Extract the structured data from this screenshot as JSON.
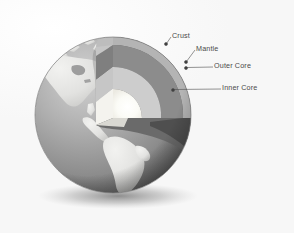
{
  "figure": {
    "background_color": "#fbfbfb",
    "style": "grayscale scanned illustration"
  },
  "labels": [
    {
      "id": "crust",
      "text": "Crust",
      "x": 172,
      "y": 33,
      "dot_x": 166,
      "dot_y": 44
    },
    {
      "id": "mantle",
      "text": "Mantle",
      "x": 196,
      "y": 46,
      "dot_x": 186,
      "dot_y": 62
    },
    {
      "id": "outer-core",
      "text": "Outer Core",
      "x": 214,
      "y": 64,
      "dot_x": 186,
      "dot_y": 68
    },
    {
      "id": "inner-core",
      "text": "Inner Core",
      "x": 222,
      "y": 86,
      "dot_x": 173,
      "dot_y": 90
    }
  ],
  "layers": [
    {
      "id": "crust",
      "name": "Crust",
      "color": "#b9b9b9"
    },
    {
      "id": "mantle",
      "name": "Mantle",
      "color": "#8f8f8f"
    },
    {
      "id": "outer-core",
      "name": "Outer Core",
      "color": "#cccccc"
    },
    {
      "id": "inner-core",
      "name": "Inner Core",
      "color": "#fbfbf7"
    }
  ],
  "globe": {
    "center_x": 113,
    "center_y": 115,
    "radius": 78,
    "ocean_color": "#9a9a9a",
    "land_color": "#e6e6e4",
    "cut_face_color": "#6f6f6f",
    "shadow_color": "#8d8d8d"
  },
  "leader_line": {
    "stroke": "#4d4d4d",
    "width": 0.6,
    "dot_radius": 1.5
  }
}
